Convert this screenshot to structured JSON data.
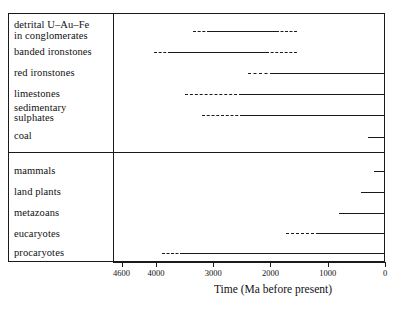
{
  "chart_data": {
    "type": "bar",
    "orientation": "horizontal",
    "title": "",
    "xlabel": "Time (Ma before present)",
    "ylabel": "",
    "xlim": [
      4750,
      0
    ],
    "x_reversed": true,
    "grid": false,
    "legend": null,
    "xticks": [
      4600,
      4000,
      3000,
      2000,
      1000,
      0
    ],
    "xtick_labels": [
      "4600",
      "4000",
      "3000",
      "2000",
      "1000",
      "0"
    ],
    "panels": [
      {
        "name": "rock-record-panel",
        "categories": [
          "detrital U–Au–Fe\nin conglomerates",
          "banded ironstones",
          "red ironstones",
          "limestones",
          "sedimentary\nsulphates",
          "coal"
        ],
        "bars": [
          {
            "label": "detrital U–Au–Fe in conglomerates",
            "start_ma": 3350,
            "end_ma": 1540,
            "segments": [
              {
                "from_ma": 3350,
                "to_ma": 3060,
                "style": "dashed"
              },
              {
                "from_ma": 3060,
                "to_ma": 1900,
                "style": "solid"
              },
              {
                "from_ma": 1900,
                "to_ma": 1540,
                "style": "dashed"
              }
            ]
          },
          {
            "label": "banded ironstones",
            "start_ma": 4040,
            "end_ma": 1540,
            "segments": [
              {
                "from_ma": 4040,
                "to_ma": 3740,
                "style": "dashed"
              },
              {
                "from_ma": 3740,
                "to_ma": 2070,
                "style": "solid"
              },
              {
                "from_ma": 2070,
                "to_ma": 1540,
                "style": "dashed"
              }
            ]
          },
          {
            "label": "red ironstones",
            "start_ma": 2400,
            "end_ma": 0,
            "segments": [
              {
                "from_ma": 2400,
                "to_ma": 1950,
                "style": "dashed"
              },
              {
                "from_ma": 1950,
                "to_ma": 0,
                "style": "solid"
              }
            ]
          },
          {
            "label": "limestones",
            "start_ma": 3500,
            "end_ma": 0,
            "segments": [
              {
                "from_ma": 3500,
                "to_ma": 2500,
                "style": "dashed"
              },
              {
                "from_ma": 2500,
                "to_ma": 0,
                "style": "solid"
              }
            ]
          },
          {
            "label": "sedimentary sulphates",
            "start_ma": 3200,
            "end_ma": 0,
            "segments": [
              {
                "from_ma": 3200,
                "to_ma": 2480,
                "style": "dashed"
              },
              {
                "from_ma": 2480,
                "to_ma": 0,
                "style": "solid"
              }
            ]
          },
          {
            "label": "coal",
            "start_ma": 300,
            "end_ma": 0,
            "segments": [
              {
                "from_ma": 300,
                "to_ma": 0,
                "style": "solid"
              }
            ]
          }
        ]
      },
      {
        "name": "life-record-panel",
        "categories": [
          "mammals",
          "land plants",
          "metazoans",
          "eucaryotes",
          "procaryotes"
        ],
        "bars": [
          {
            "label": "mammals",
            "start_ma": 200,
            "end_ma": 0,
            "segments": [
              {
                "from_ma": 200,
                "to_ma": 0,
                "style": "solid"
              }
            ]
          },
          {
            "label": "land plants",
            "start_ma": 420,
            "end_ma": 0,
            "segments": [
              {
                "from_ma": 420,
                "to_ma": 0,
                "style": "solid"
              }
            ]
          },
          {
            "label": "metazoans",
            "start_ma": 800,
            "end_ma": 0,
            "segments": [
              {
                "from_ma": 800,
                "to_ma": 0,
                "style": "solid"
              }
            ]
          },
          {
            "label": "eucaryotes",
            "start_ma": 1730,
            "end_ma": 0,
            "segments": [
              {
                "from_ma": 1730,
                "to_ma": 1150,
                "style": "dashed"
              },
              {
                "from_ma": 1150,
                "to_ma": 0,
                "style": "solid"
              }
            ]
          },
          {
            "label": "procaryotes",
            "start_ma": 3900,
            "end_ma": 0,
            "segments": [
              {
                "from_ma": 3900,
                "to_ma": 3520,
                "style": "dashed"
              },
              {
                "from_ma": 3520,
                "to_ma": 0,
                "style": "solid"
              }
            ]
          }
        ]
      }
    ],
    "colors": {
      "line": "#1a1a1a",
      "frame": "#1a1a1a",
      "background": "#ffffff"
    }
  },
  "labels": {
    "detrital_line1": "detrital U–Au–Fe",
    "detrital_line2": "in conglomerates",
    "banded_ironstones": "banded ironstones",
    "red_ironstones": "red ironstones",
    "limestones": "limestones",
    "sedimentary_line1": "sedimentary",
    "sedimentary_line2": "sulphates",
    "coal": "coal",
    "mammals": "mammals",
    "land_plants": "land plants",
    "metazoans": "metazoans",
    "eucaryotes": "eucaryotes",
    "procaryotes": "procaryotes"
  },
  "axis": {
    "title": "Time (Ma before present)",
    "ticks": [
      "4600",
      "4000",
      "3000",
      "2000",
      "1000",
      "0"
    ]
  }
}
